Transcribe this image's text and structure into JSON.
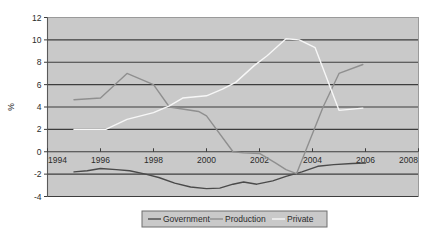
{
  "chart_data": {
    "type": "line",
    "title": "",
    "xlabel": "",
    "ylabel": "%",
    "xlim": [
      1994,
      2008
    ],
    "ylim": [
      -4,
      12
    ],
    "xticks": [
      1994,
      1996,
      1998,
      2000,
      2002,
      2004,
      2006,
      2008
    ],
    "xtick_labels": [
      "1994",
      "1996",
      "1998",
      "2000",
      "2002",
      "2004",
      "2006",
      "2008"
    ],
    "yticks": [
      -4,
      -2,
      0,
      2,
      4,
      6,
      8,
      10,
      12
    ],
    "ytick_labels": [
      "-4",
      "-2",
      "0",
      "2",
      "4",
      "6",
      "8",
      "10",
      "12"
    ],
    "grid": true,
    "grid_axis": "y",
    "plot_background": "#c9c9c9",
    "legend_position": "bottom",
    "series": [
      {
        "name": "Government",
        "color": "#4a4a4a",
        "points": [
          [
            1995.0,
            -1.8
          ],
          [
            1995.5,
            -1.7
          ],
          [
            1996.0,
            -1.5
          ],
          [
            1996.6,
            -1.6
          ],
          [
            1997.1,
            -1.7
          ],
          [
            1997.7,
            -2.0
          ],
          [
            1998.2,
            -2.3
          ],
          [
            1998.8,
            -2.8
          ],
          [
            1999.4,
            -3.15
          ],
          [
            2000.0,
            -3.3
          ],
          [
            2000.5,
            -3.25
          ],
          [
            2001.0,
            -2.9
          ],
          [
            2001.4,
            -2.7
          ],
          [
            2001.9,
            -2.9
          ],
          [
            2002.5,
            -2.6
          ],
          [
            2003.0,
            -2.2
          ],
          [
            2003.6,
            -1.8
          ],
          [
            2004.2,
            -1.3
          ],
          [
            2004.8,
            -1.15
          ],
          [
            2005.5,
            -1.05
          ],
          [
            2006.0,
            -1.0
          ]
        ]
      },
      {
        "name": "Production",
        "color": "#8f8f8f",
        "points": [
          [
            1995.0,
            4.65
          ],
          [
            1996.0,
            4.8
          ],
          [
            1997.0,
            7.0
          ],
          [
            1998.0,
            6.0
          ],
          [
            1998.6,
            4.0
          ],
          [
            1999.7,
            3.6
          ],
          [
            2000.0,
            3.2
          ],
          [
            2001.0,
            0.0
          ],
          [
            2001.4,
            -0.1
          ],
          [
            2002.0,
            -0.15
          ],
          [
            2002.6,
            -1.0
          ],
          [
            2003.0,
            -1.6
          ],
          [
            2003.4,
            -1.95
          ],
          [
            2004.4,
            4.0
          ],
          [
            2005.0,
            7.0
          ],
          [
            2005.9,
            7.8
          ]
        ]
      },
      {
        "name": "Private",
        "color": "#f7f7f7",
        "points": [
          [
            1995.0,
            2.0
          ],
          [
            1996.2,
            2.0
          ],
          [
            1997.0,
            2.9
          ],
          [
            1998.0,
            3.5
          ],
          [
            1998.6,
            4.1
          ],
          [
            1999.1,
            4.8
          ],
          [
            2000.0,
            5.0
          ],
          [
            2000.6,
            5.6
          ],
          [
            2001.1,
            6.2
          ],
          [
            2001.8,
            7.7
          ],
          [
            2002.3,
            8.6
          ],
          [
            2003.0,
            10.1
          ],
          [
            2003.5,
            10.0
          ],
          [
            2004.1,
            9.3
          ],
          [
            2005.0,
            3.7
          ],
          [
            2005.9,
            3.9
          ]
        ]
      }
    ]
  },
  "legend": {
    "items": [
      {
        "label": "Government"
      },
      {
        "label": "Production"
      },
      {
        "label": "Private"
      }
    ]
  },
  "axis": {
    "ylabel": "%"
  }
}
